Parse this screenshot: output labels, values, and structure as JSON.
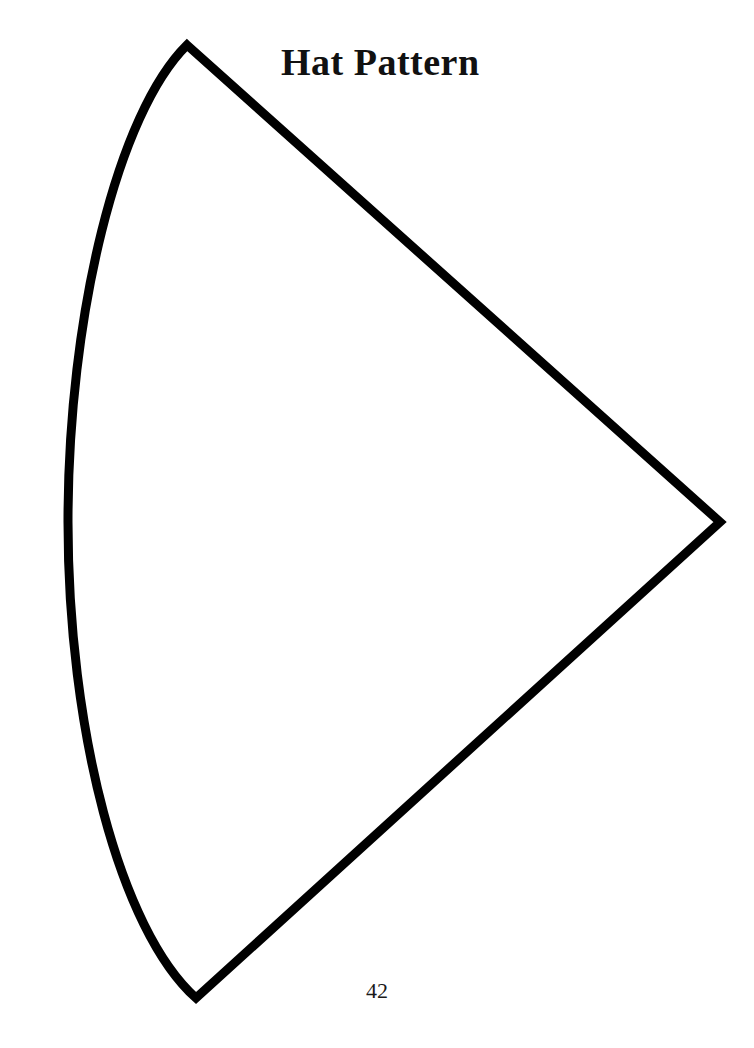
{
  "page": {
    "title": "Hat Pattern",
    "page_number": "42",
    "background_color": "#ffffff",
    "ink_color": "#000000",
    "width": 754,
    "height": 1048
  },
  "pattern": {
    "name": "hat-pattern-cone-sector",
    "description": "Circular sector (cone / fan) cutting pattern outline",
    "stroke_color": "#000000",
    "stroke_width": 9,
    "fill": "none",
    "apex": {
      "x": 720,
      "y": 522
    },
    "top_vertex": {
      "x": 187,
      "y": 45
    },
    "bottom_vertex": {
      "x": 196,
      "y": 998
    },
    "arc_leftmost": {
      "x": 68,
      "y": 522
    },
    "path": "M 187 45 L 720 522 L 196 998 C 120 930 68 730 68 522 C 68 315 118 113 187 45 Z"
  }
}
